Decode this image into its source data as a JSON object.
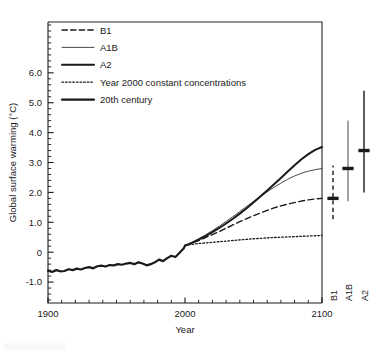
{
  "chart_data": {
    "type": "line",
    "title": "",
    "xlabel": "Year",
    "ylabel": "Global surface warming (°C)",
    "xlim": [
      1900,
      2100
    ],
    "ylim": [
      -1.7,
      7.7
    ],
    "xticks": [
      1900,
      2000,
      2100
    ],
    "xtick_labels": [
      "1900",
      "2000",
      "2100"
    ],
    "yticks": [
      -1.0,
      0,
      1.0,
      2.0,
      3.0,
      4.0,
      5.0,
      6.0
    ],
    "ytick_labels": [
      "-1.0",
      "0",
      "1.0",
      "2.0",
      "3.0",
      "4.0",
      "5.0",
      "6.0"
    ],
    "ytick_minor_step": 0.2,
    "grid": false,
    "legend_position": "upper-left",
    "series": [
      {
        "name": "B1",
        "style": "dashed",
        "line_width": 1.4,
        "color": "#1a1a1a",
        "x": [
          2000,
          2005,
          2010,
          2015,
          2020,
          2025,
          2030,
          2035,
          2040,
          2045,
          2050,
          2055,
          2060,
          2065,
          2070,
          2075,
          2080,
          2085,
          2090,
          2095,
          2100
        ],
        "y": [
          0.22,
          0.3,
          0.39,
          0.49,
          0.59,
          0.69,
          0.8,
          0.91,
          1.02,
          1.12,
          1.22,
          1.31,
          1.4,
          1.48,
          1.55,
          1.61,
          1.66,
          1.71,
          1.75,
          1.78,
          1.8
        ]
      },
      {
        "name": "A1B",
        "style": "solid",
        "line_width": 1.0,
        "color": "#4a4a4a",
        "x": [
          2000,
          2005,
          2010,
          2015,
          2020,
          2025,
          2030,
          2035,
          2040,
          2045,
          2050,
          2055,
          2060,
          2065,
          2070,
          2075,
          2080,
          2085,
          2090,
          2095,
          2100
        ],
        "y": [
          0.22,
          0.33,
          0.45,
          0.58,
          0.72,
          0.87,
          1.03,
          1.19,
          1.36,
          1.53,
          1.7,
          1.86,
          2.02,
          2.17,
          2.31,
          2.44,
          2.55,
          2.64,
          2.71,
          2.76,
          2.8
        ]
      },
      {
        "name": "A2",
        "style": "solid",
        "line_width": 2.0,
        "color": "#1a1a1a",
        "x": [
          2000,
          2005,
          2010,
          2015,
          2020,
          2025,
          2030,
          2035,
          2040,
          2045,
          2050,
          2055,
          2060,
          2065,
          2070,
          2075,
          2080,
          2085,
          2090,
          2095,
          2100
        ],
        "y": [
          0.22,
          0.31,
          0.42,
          0.54,
          0.67,
          0.81,
          0.96,
          1.12,
          1.29,
          1.47,
          1.66,
          1.86,
          2.06,
          2.27,
          2.48,
          2.7,
          2.91,
          3.11,
          3.28,
          3.42,
          3.52
        ]
      },
      {
        "name": "Year 2000 constant concentrations",
        "style": "dotted",
        "line_width": 1.3,
        "color": "#1a1a1a",
        "x": [
          2000,
          2005,
          2010,
          2015,
          2020,
          2025,
          2030,
          2035,
          2040,
          2045,
          2050,
          2055,
          2060,
          2065,
          2070,
          2075,
          2080,
          2085,
          2090,
          2095,
          2100
        ],
        "y": [
          0.22,
          0.26,
          0.29,
          0.31,
          0.33,
          0.35,
          0.37,
          0.39,
          0.41,
          0.43,
          0.45,
          0.46,
          0.48,
          0.49,
          0.5,
          0.51,
          0.52,
          0.53,
          0.54,
          0.55,
          0.56
        ]
      },
      {
        "name": "20th century",
        "style": "solid",
        "line_width": 2.2,
        "color": "#1a1a1a",
        "x": [
          1900,
          1903,
          1906,
          1909,
          1912,
          1915,
          1918,
          1921,
          1924,
          1927,
          1930,
          1933,
          1936,
          1939,
          1942,
          1945,
          1948,
          1951,
          1954,
          1957,
          1960,
          1963,
          1966,
          1969,
          1972,
          1975,
          1978,
          1981,
          1984,
          1987,
          1990,
          1993,
          1996,
          1999,
          2000
        ],
        "y": [
          -0.62,
          -0.66,
          -0.6,
          -0.64,
          -0.63,
          -0.57,
          -0.6,
          -0.55,
          -0.58,
          -0.53,
          -0.5,
          -0.54,
          -0.47,
          -0.45,
          -0.48,
          -0.43,
          -0.44,
          -0.4,
          -0.42,
          -0.38,
          -0.36,
          -0.4,
          -0.34,
          -0.38,
          -0.44,
          -0.4,
          -0.34,
          -0.25,
          -0.3,
          -0.2,
          -0.12,
          -0.16,
          -0.02,
          0.12,
          0.22
        ]
      }
    ],
    "legend": [
      {
        "label": "B1",
        "style": "dashed",
        "line_width": 1.4
      },
      {
        "label": "A1B",
        "style": "solid",
        "line_width": 1.0
      },
      {
        "label": "A2",
        "style": "solid",
        "line_width": 2.0
      },
      {
        "label": "Year 2000 constant concentrations",
        "style": "dotted",
        "line_width": 1.3
      },
      {
        "label": "20th century",
        "style": "solid",
        "line_width": 2.2
      }
    ],
    "range_bars": [
      {
        "label": "B1",
        "low": 1.1,
        "high": 2.9,
        "best": 1.8,
        "style": "dashed",
        "line_width": 1.4
      },
      {
        "label": "A1B",
        "low": 1.7,
        "high": 4.4,
        "best": 2.8,
        "style": "solid",
        "line_width": 1.0
      },
      {
        "label": "A2",
        "low": 2.0,
        "high": 5.4,
        "best": 3.4,
        "style": "solid",
        "line_width": 1.4
      }
    ],
    "colors": {
      "ink": "#1a1a1a",
      "mid_ink": "#4a4a4a",
      "background": "#ffffff"
    }
  }
}
